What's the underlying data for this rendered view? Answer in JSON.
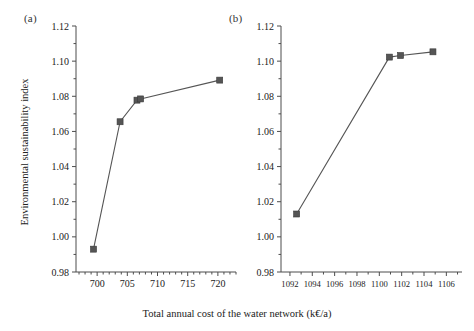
{
  "figure": {
    "xlabel": "Total annual cost of the water network (k€/a)",
    "ylabel": "Environmental sustainability index",
    "panel_a_label": "(a)",
    "panel_b_label": "(b)"
  },
  "chart_data": [
    {
      "type": "line",
      "panel": "(a)",
      "title": "",
      "xlabel": "Total annual cost of the water network (k€/a)",
      "ylabel": "Environmental sustainability index",
      "xlim": [
        696.5,
        723.0
      ],
      "ylim": [
        0.98,
        1.12
      ],
      "xticks": [
        700,
        705,
        710,
        715,
        720
      ],
      "xticklabels": [
        "700",
        "705",
        "710",
        "715",
        "720"
      ],
      "yticks": [
        0.98,
        1.0,
        1.02,
        1.04,
        1.06,
        1.08,
        1.1,
        1.12
      ],
      "yticklabels": [
        "0.98",
        "1.00",
        "1.02",
        "1.04",
        "1.06",
        "1.08",
        "1.10",
        "1.12"
      ],
      "grid": false,
      "legend": "none",
      "marker": "square",
      "series": [
        {
          "name": "Pareto front (a)",
          "x": [
            699.4,
            703.8,
            706.6,
            707.2,
            720.3
          ],
          "y": [
            0.993,
            1.0655,
            1.0778,
            1.0785,
            1.0892
          ]
        }
      ]
    },
    {
      "type": "line",
      "panel": "(b)",
      "title": "",
      "xlabel": "Total annual cost of the water network (k€/a)",
      "ylabel": "Environmental sustainability index",
      "xlim": [
        1091.2,
        1107.4
      ],
      "ylim": [
        0.98,
        1.12
      ],
      "xticks": [
        1092,
        1094,
        1096,
        1098,
        1100,
        1102,
        1104,
        1106
      ],
      "xticklabels": [
        "1092",
        "1094",
        "1096",
        "1098",
        "1100",
        "1102",
        "1104",
        "1106"
      ],
      "yticks": [
        0.98,
        1.0,
        1.02,
        1.04,
        1.06,
        1.08,
        1.1,
        1.12
      ],
      "yticklabels": [
        "0.98",
        "1.00",
        "1.02",
        "1.04",
        "1.06",
        "1.08",
        "1.10",
        "1.12"
      ],
      "grid": false,
      "legend": "none",
      "marker": "square",
      "series": [
        {
          "name": "Pareto front (b)",
          "x": [
            1092.6,
            1100.9,
            1101.9,
            1104.8
          ],
          "y": [
            1.013,
            1.1023,
            1.1032,
            1.1053
          ]
        }
      ]
    }
  ]
}
